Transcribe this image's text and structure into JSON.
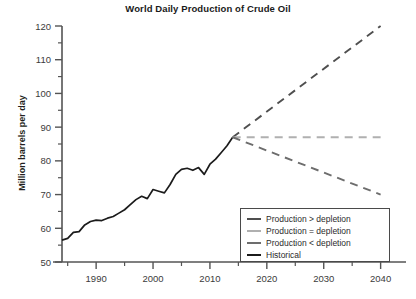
{
  "chart_data": {
    "type": "line",
    "title": "World Daily Production of Crude Oil",
    "xlabel": "",
    "ylabel": "Million barrels per day",
    "xlim": [
      1984,
      2042
    ],
    "ylim": [
      50,
      120
    ],
    "xticks": [
      1990,
      2000,
      2010,
      2020,
      2030,
      2040
    ],
    "xtick_labels": [
      "1990",
      "2000",
      "2010",
      "2020",
      "2030",
      "2040"
    ],
    "x_minor_ticks": [
      1985,
      1995,
      2005,
      2015,
      2025,
      2035
    ],
    "yticks": [
      50,
      60,
      70,
      80,
      90,
      100,
      110,
      120
    ],
    "ytick_labels": [
      "50",
      "60",
      "70",
      "80",
      "90",
      "100",
      "110",
      "120"
    ],
    "y_minor_ticks": [
      55,
      65,
      75,
      85,
      95,
      105,
      115
    ],
    "grid": false,
    "legend_position": "lower right",
    "series": [
      {
        "name": "Historical",
        "style": "solid",
        "color": "#1b1b1b",
        "x": [
          1984,
          1985,
          1986,
          1987,
          1988,
          1989,
          1990,
          1991,
          1992,
          1993,
          1994,
          1995,
          1996,
          1997,
          1998,
          1999,
          2000,
          2001,
          2002,
          2003,
          2004,
          2005,
          2006,
          2007,
          2008,
          2009,
          2010,
          2011,
          2012,
          2013,
          2014
        ],
        "values": [
          56.5,
          57.0,
          58.8,
          59.0,
          61.0,
          62.0,
          62.4,
          62.3,
          63.0,
          63.5,
          64.5,
          65.5,
          67.0,
          68.5,
          69.5,
          68.8,
          71.5,
          71.0,
          70.5,
          73.0,
          76.0,
          77.5,
          77.8,
          77.2,
          78.0,
          76.0,
          79.0,
          80.5,
          82.5,
          84.5,
          87.0
        ]
      },
      {
        "name": "Production > depletion",
        "style": "dashed",
        "color": "#4f4f4f",
        "x": [
          2014,
          2040
        ],
        "values": [
          87,
          120
        ]
      },
      {
        "name": "Production = depletion",
        "style": "dashed",
        "color": "#b0b0b0",
        "x": [
          2014,
          2040
        ],
        "values": [
          87,
          87
        ]
      },
      {
        "name": "Production < depletion",
        "style": "dashed",
        "color": "#6d6d6d",
        "x": [
          2014,
          2040
        ],
        "values": [
          87,
          70
        ]
      }
    ]
  },
  "legend": {
    "items": [
      {
        "label": "Production > depletion",
        "color": "#4f4f4f"
      },
      {
        "label": "Production = depletion",
        "color": "#b0b0b0"
      },
      {
        "label": "Production < depletion",
        "color": "#6d6d6d"
      },
      {
        "label": "Historical",
        "color": "#1b1b1b"
      }
    ]
  }
}
